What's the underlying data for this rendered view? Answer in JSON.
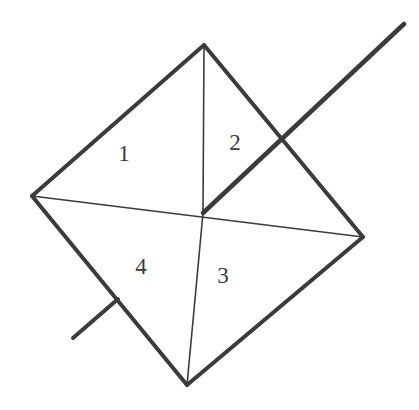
{
  "figure": {
    "background_color": "#ffffff",
    "stroke_color": "#3b3b3b",
    "canvas": {
      "width": 419,
      "height": 410
    },
    "vertices": {
      "top": {
        "label": "top-vertex",
        "x": 204,
        "y": 45
      },
      "left": {
        "label": "left-vertex",
        "x": 32,
        "y": 196
      },
      "right": {
        "label": "right-vertex",
        "x": 363,
        "y": 237
      },
      "bottom": {
        "label": "bottom-vertex",
        "x": 187,
        "y": 385
      },
      "center": {
        "label": "center-intersection",
        "x": 203,
        "y": 213
      }
    },
    "outline_edges": [
      {
        "name": "edge-top-left",
        "from": "top",
        "to": "left",
        "stroke_width": 4
      },
      {
        "name": "edge-top-right",
        "from": "top",
        "to": "right",
        "stroke_width": 4
      },
      {
        "name": "edge-bottom-right",
        "from": "right",
        "to": "bottom",
        "stroke_width": 4
      },
      {
        "name": "edge-bottom-left",
        "from": "bottom",
        "to": "left",
        "stroke_width": 4
      }
    ],
    "internal_lines": [
      {
        "name": "diagonal-horizontal",
        "from": "left",
        "to": "right",
        "stroke_width": 1.6
      },
      {
        "name": "segment-top-center",
        "from": "top",
        "to": "center",
        "stroke_width": 1.6
      },
      {
        "name": "segment-center-bottom",
        "from": "center",
        "to": "bottom",
        "stroke_width": 1.6
      }
    ],
    "ray": {
      "name": "ray-center-upper-right",
      "from": {
        "x": 203,
        "y": 213
      },
      "to": {
        "x": 404,
        "y": 24
      },
      "crosses_edge_at": {
        "x": 285,
        "y": 141
      },
      "stroke_width": 4.5
    },
    "tick": {
      "name": "tick-mark-lower-left-edge",
      "from": {
        "x": 73,
        "y": 338
      },
      "to": {
        "x": 118,
        "y": 299
      },
      "stroke_width": 4
    },
    "labels": [
      {
        "name": "region-label-1",
        "text": "1",
        "x": 124,
        "y": 153
      },
      {
        "name": "region-label-2",
        "text": "2",
        "x": 235,
        "y": 142
      },
      {
        "name": "region-label-3",
        "text": "3",
        "x": 223,
        "y": 275
      },
      {
        "name": "region-label-4",
        "text": "4",
        "x": 141,
        "y": 266
      }
    ]
  }
}
